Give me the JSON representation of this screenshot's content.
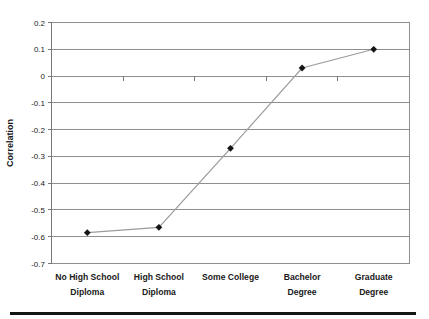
{
  "chart_data": {
    "type": "line",
    "title": "",
    "xlabel": "",
    "ylabel": "Correlation",
    "categories": [
      "No High School Diploma",
      "High School Diploma",
      "Some College",
      "Bachelor Degree",
      "Graduate Degree"
    ],
    "category_label_lines": [
      [
        "No High School",
        "Diploma"
      ],
      [
        "High School",
        "Diploma"
      ],
      [
        "Some College"
      ],
      [
        "Bachelor",
        "Degree"
      ],
      [
        "Graduate",
        "Degree"
      ]
    ],
    "values": [
      -0.585,
      -0.565,
      -0.27,
      0.03,
      0.1
    ],
    "ylim": [
      -0.7,
      0.2
    ],
    "ytick_interval": 0.1,
    "ytick_labels": [
      "0.2",
      "0.1",
      "0",
      "-0.1",
      "-0.2",
      "-0.3",
      "-0.4",
      "-0.5",
      "-0.6",
      "-0.7"
    ],
    "grid": true,
    "legend": false,
    "marker": "diamond",
    "colors": {
      "line": "#9c9c9c",
      "marker": "#141414",
      "grid": "#8f8f8f",
      "axis": "#787878",
      "text": "#1a1a1a",
      "background": "#ffffff"
    }
  }
}
